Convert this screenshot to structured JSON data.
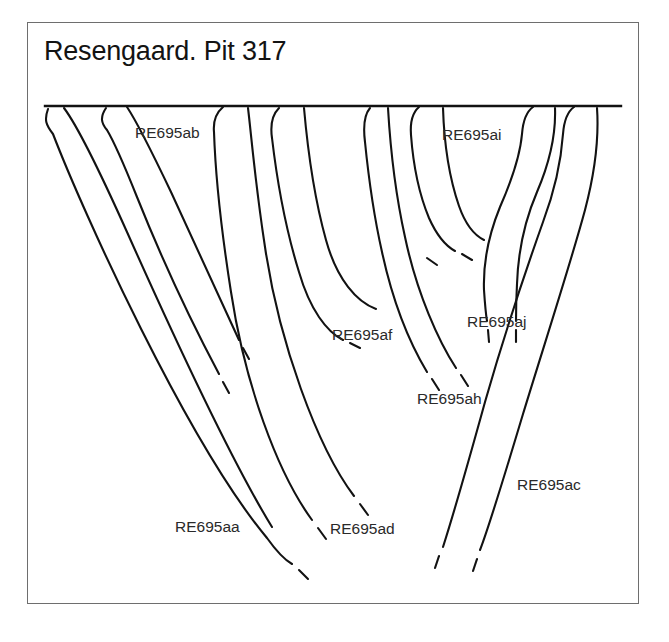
{
  "figure": {
    "title": "Resengaard. Pit 317",
    "border_color": "#6e6e6e",
    "background_color": "#ffffff",
    "ink_color": "#121212"
  },
  "ground_line": {
    "name": "ground-surface-line",
    "x1": 18,
    "x2": 594,
    "y": 84
  },
  "labels": [
    {
      "id": "ab",
      "text": "RE695ab",
      "x": 108,
      "y": 116
    },
    {
      "id": "ai",
      "text": "RE695ai",
      "x": 415,
      "y": 118
    },
    {
      "id": "af",
      "text": "RE695af",
      "x": 305,
      "y": 318
    },
    {
      "id": "aj",
      "text": "RE695aj",
      "x": 440,
      "y": 305
    },
    {
      "id": "ah",
      "text": "RE695ah",
      "x": 390,
      "y": 382
    },
    {
      "id": "ac",
      "text": "RE695ac",
      "x": 490,
      "y": 468
    },
    {
      "id": "aa",
      "text": "RE695aa",
      "x": 148,
      "y": 510
    },
    {
      "id": "ad",
      "text": "RE695ad",
      "x": 303,
      "y": 512
    }
  ],
  "stakes": [
    {
      "id": "aa",
      "name": "stake-re695aa",
      "label": "RE695aa",
      "top_x": 21,
      "outline": "M 21 87 C 17 98 19 103 26 112 C 56 190 160 420 240 516 C 250 530 258 538 265 542",
      "tip_dash": "M 272 548 L 281 557"
    },
    {
      "id": "aa-right",
      "name": "stake-re695aa-inner-edge",
      "label": "RE695aa",
      "top_x": 40,
      "outline": "M 37 86 C 52 106 74 152 100 210 C 150 322 205 440 245 505",
      "tip_dash": null
    },
    {
      "id": "ab",
      "name": "stake-re695ab",
      "label": "RE695ab",
      "top_x": 82,
      "outline": "M 79 86 C 73 95 74 101 80 108 C 86 118 96 140 110 175 C 140 250 175 320 192 352",
      "tip_dash": "M 196 360 L 202 371"
    },
    {
      "id": "ab-right",
      "name": "stake-re695ab-inner-edge",
      "label": "RE695ab",
      "top_x": 103,
      "outline": "M 100 85 C 110 100 124 128 144 170 C 172 230 198 288 212 318",
      "tip_dash": "M 216 326 L 222 337"
    },
    {
      "id": "ad",
      "name": "stake-re695ad",
      "label": "RE695ad",
      "top_x": 198,
      "outline": "M 196 85 C 189 91 186 99 187 110 C 188 140 193 200 204 270 C 218 362 250 450 285 498",
      "tip_dash": "M 291 506 L 299 517"
    },
    {
      "id": "ad-right",
      "name": "stake-re695ad-inner-edge",
      "label": "RE695ad",
      "top_x": 221,
      "outline": "M 221 86 C 224 110 228 160 238 225 C 252 320 290 425 327 474",
      "tip_dash": "M 333 482 L 341 493"
    },
    {
      "id": "af",
      "name": "stake-re695af",
      "label": "RE695af",
      "top_x": 255,
      "outline": "M 252 86 C 245 93 243 102 245 116 C 249 150 258 205 272 250 C 283 288 300 310 316 318",
      "tip_dash": "M 323 321 L 333 326"
    },
    {
      "id": "af-right",
      "name": "stake-re695af-inner-edge",
      "label": "RE695af",
      "top_x": 277,
      "outline": "M 277 86 C 280 120 287 175 299 218 C 310 258 330 280 349 287",
      "tip_dash": null
    },
    {
      "id": "ah",
      "name": "stake-re695ah",
      "label": "RE695ah",
      "top_x": 345,
      "outline": "M 343 86 C 337 93 336 104 338 120 C 341 150 346 190 355 230 C 368 290 388 330 400 350",
      "tip_dash": "M 405 357 L 412 368"
    },
    {
      "id": "ah-right",
      "name": "stake-re695ah-inner-edge",
      "label": "RE695ah",
      "top_x": 361,
      "outline": "M 361 86 C 363 120 368 170 378 215 C 390 272 412 320 429 346",
      "tip_dash": "M 434 353 L 441 364"
    },
    {
      "id": "ai",
      "name": "stake-re695ai",
      "label": "RE695ai",
      "top_x": 394,
      "outline": "M 392 85 C 385 91 383 100 384 113 C 386 140 392 172 402 196 C 410 214 419 224 428 229",
      "tip_dash": "M 435 232 L 445 238"
    },
    {
      "id": "ai-right",
      "name": "stake-re695ai-inner-edge",
      "label": "RE695ai",
      "top_x": 416,
      "outline": "M 416 86 C 417 118 422 155 432 184 C 439 204 449 214 457 218",
      "tip_dash": "M 400 236 L 410 243"
    },
    {
      "id": "aj",
      "name": "stake-re695aj",
      "label": "RE695aj",
      "top_x": 508,
      "outline": "M 506 85 C 499 90 496 99 495 112 C 493 135 484 160 473 185 C 462 212 456 240 457 268 C 458 283 459 293 460 299",
      "tip_dash": "M 461 308 L 462 320"
    },
    {
      "id": "aj-right",
      "name": "stake-re695aj-inner-edge",
      "label": "RE695aj",
      "top_x": 528,
      "outline": "M 528 86 C 529 112 522 142 510 170 C 498 198 491 232 490 262 C 489 280 489 292 489 299",
      "tip_dash": "M 489 308 L 489 320"
    },
    {
      "id": "ac",
      "name": "stake-re695ac",
      "label": "RE695ac",
      "top_x": 549,
      "outline": "M 547 85 C 540 90 537 99 536 112 C 534 140 528 168 516 200 C 500 245 478 310 458 380 C 440 445 424 500 416 525",
      "tip_dash": "M 412 534 L 408 546"
    },
    {
      "id": "ac-right",
      "name": "stake-re695ac-inner-edge",
      "label": "RE695ac",
      "top_x": 571,
      "outline": "M 570 86 C 572 115 568 150 558 188 C 544 240 518 320 496 392 C 478 452 462 505 453 528",
      "tip_dash": "M 450 537 L 446 549"
    }
  ]
}
